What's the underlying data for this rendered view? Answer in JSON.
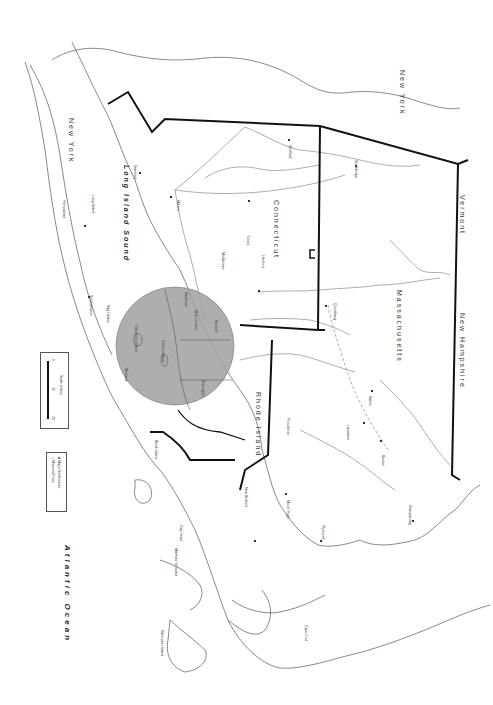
{
  "map": {
    "orientation": "rotated 90 degrees clockwise",
    "colors": {
      "background": "#ffffff",
      "coastline": "#555555",
      "state_border": "#111111",
      "highlight_circle": "#a0a0a0",
      "route_dashed": "#777777"
    },
    "states": [
      {
        "id": "new-york-upstate",
        "label": "New York"
      },
      {
        "id": "new-york-li",
        "label": "New York"
      },
      {
        "id": "connecticut",
        "label": "Connecticut"
      },
      {
        "id": "massachusetts",
        "label": "Massachusetts"
      },
      {
        "id": "rhode-island",
        "label": "Rhode Island"
      },
      {
        "id": "vermont",
        "label": "Vermont"
      },
      {
        "id": "new-hampshire",
        "label": "New Hampshire"
      }
    ],
    "water_bodies": [
      {
        "id": "long-island-sound",
        "label": "Long Island Sound"
      },
      {
        "id": "atlantic-ocean",
        "label": "Atlantic Ocean"
      }
    ],
    "places": [
      {
        "id": "long-island",
        "label": "Long Island"
      },
      {
        "id": "hartford",
        "label": "Hartford"
      },
      {
        "id": "providence",
        "label": "Providence"
      },
      {
        "id": "boston",
        "label": "Boston"
      },
      {
        "id": "block-island",
        "label": "Block Island"
      },
      {
        "id": "marthas-vineyard",
        "label": "Martha's Vineyard"
      },
      {
        "id": "nantucket-island",
        "label": "Nantucket Island"
      },
      {
        "id": "new-bedford",
        "label": "New Bedford"
      },
      {
        "id": "cape-cod",
        "label": "Cape Cod"
      },
      {
        "id": "gay-head",
        "label": "Gay Head"
      },
      {
        "id": "fishers-island",
        "label": "Fishers Island"
      },
      {
        "id": "gardiners-island",
        "label": "Gardiner's Island"
      },
      {
        "id": "montauk",
        "label": "Montauk"
      },
      {
        "id": "sag-harbor",
        "label": "Sag Harbor"
      },
      {
        "id": "southampton",
        "label": "Southampton"
      },
      {
        "id": "new-london",
        "label": "New London"
      },
      {
        "id": "mystic",
        "label": "Mystic"
      },
      {
        "id": "stonington",
        "label": "Stonington"
      },
      {
        "id": "norwich",
        "label": "Norwich"
      },
      {
        "id": "saybrook",
        "label": "Saybrook"
      },
      {
        "id": "middletown",
        "label": "Middletown"
      },
      {
        "id": "wethersfield",
        "label": "Wethersfield"
      },
      {
        "id": "windsor",
        "label": "Windsor"
      },
      {
        "id": "springfield",
        "label": "Springfield"
      },
      {
        "id": "northampton",
        "label": "Northampton"
      },
      {
        "id": "deerfield",
        "label": "Deerfield"
      },
      {
        "id": "quinebaug",
        "label": "Quinebaug"
      },
      {
        "id": "plymouth",
        "label": "Plymouth"
      },
      {
        "id": "mount-hope",
        "label": "Mount Hope"
      },
      {
        "id": "dedham",
        "label": "Dedham"
      },
      {
        "id": "marlborough",
        "label": "Marlborough"
      },
      {
        "id": "sudbury",
        "label": "Sudbury"
      },
      {
        "id": "lancaster",
        "label": "Lancaster"
      },
      {
        "id": "salem",
        "label": "Salem"
      },
      {
        "id": "wampanoag",
        "label": "Wampanoag"
      },
      {
        "id": "greenwich",
        "label": "Greenwich"
      },
      {
        "id": "stamford",
        "label": "Stamford"
      },
      {
        "id": "new-haven",
        "label": "New Haven"
      },
      {
        "id": "fairfield",
        "label": "Fairfield"
      },
      {
        "id": "milford",
        "label": "Milford"
      },
      {
        "id": "tunxis",
        "label": "Tunxis"
      },
      {
        "id": "sheffield",
        "label": "Sheffield"
      },
      {
        "id": "stockbridge",
        "label": "Stockbridge"
      },
      {
        "id": "hempstead",
        "label": "Hempstead"
      }
    ],
    "legend": {
      "scale": {
        "title": "Scale (miles)",
        "ticks": [
          "0",
          "10",
          "20"
        ]
      },
      "key": {
        "items": [
          {
            "symbol": "■",
            "label": "Major Settlements"
          },
          {
            "symbol": "+",
            "label": "Missions/Forts"
          }
        ]
      }
    }
  }
}
